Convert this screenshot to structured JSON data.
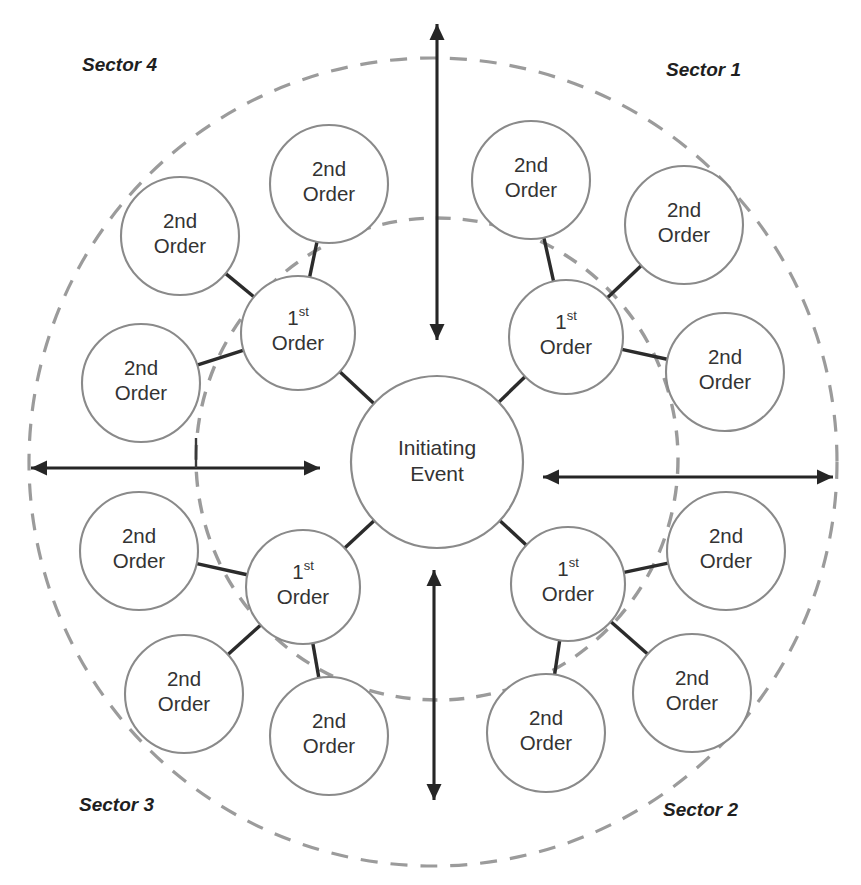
{
  "diagram": {
    "center_node": {
      "id": "initiating-event",
      "line1": "Initiating",
      "line2": "Event",
      "cx": 437,
      "cy": 462,
      "r": 86
    },
    "first_order_label": {
      "main": "1",
      "suffix": "st",
      "line2": "Order"
    },
    "second_order_label": {
      "line1": "2nd",
      "line2": "Order"
    },
    "rings": [
      {
        "id": "inner-dashed-ring",
        "cx": 437,
        "cy": 459,
        "r": 241,
        "style": "dashed"
      },
      {
        "id": "outer-dashed-ring",
        "cx": 433,
        "cy": 462,
        "r": 404,
        "style": "dashed"
      }
    ],
    "first_order_nodes": [
      {
        "id": "first-order-sector1",
        "sector": "Sector 1",
        "cx": 566,
        "cy": 337,
        "r": 57
      },
      {
        "id": "first-order-sector2",
        "sector": "Sector 2",
        "cx": 568,
        "cy": 584,
        "r": 57
      },
      {
        "id": "first-order-sector3",
        "sector": "Sector 3",
        "cx": 303,
        "cy": 587,
        "r": 57
      },
      {
        "id": "first-order-sector4",
        "sector": "Sector 4",
        "cx": 298,
        "cy": 333,
        "r": 57
      }
    ],
    "second_order_nodes": [
      {
        "id": "second-order-s1-a",
        "sector": "Sector 1",
        "cx": 531,
        "cy": 180,
        "r": 59
      },
      {
        "id": "second-order-s1-b",
        "sector": "Sector 1",
        "cx": 684,
        "cy": 225,
        "r": 59
      },
      {
        "id": "second-order-s1-c",
        "sector": "Sector 1",
        "cx": 725,
        "cy": 372,
        "r": 59
      },
      {
        "id": "second-order-s2-a",
        "sector": "Sector 2",
        "cx": 726,
        "cy": 551,
        "r": 59
      },
      {
        "id": "second-order-s2-b",
        "sector": "Sector 2",
        "cx": 692,
        "cy": 693,
        "r": 59
      },
      {
        "id": "second-order-s2-c",
        "sector": "Sector 2",
        "cx": 546,
        "cy": 733,
        "r": 59
      },
      {
        "id": "second-order-s3-a",
        "sector": "Sector 3",
        "cx": 329,
        "cy": 736,
        "r": 59
      },
      {
        "id": "second-order-s3-b",
        "sector": "Sector 3",
        "cx": 184,
        "cy": 694,
        "r": 59
      },
      {
        "id": "second-order-s3-c",
        "sector": "Sector 3",
        "cx": 139,
        "cy": 551,
        "r": 59
      },
      {
        "id": "second-order-s4-a",
        "sector": "Sector 4",
        "cx": 141,
        "cy": 383,
        "r": 59
      },
      {
        "id": "second-order-s4-b",
        "sector": "Sector 4",
        "cx": 180,
        "cy": 236,
        "r": 59
      },
      {
        "id": "second-order-s4-c",
        "sector": "Sector 4",
        "cx": 329,
        "cy": 184,
        "r": 59
      }
    ],
    "connectors": [
      {
        "from": "initiating-event",
        "to": "first-order-sector1"
      },
      {
        "from": "initiating-event",
        "to": "first-order-sector2"
      },
      {
        "from": "initiating-event",
        "to": "first-order-sector3"
      },
      {
        "from": "initiating-event",
        "to": "first-order-sector4"
      },
      {
        "from": "first-order-sector1",
        "to": "second-order-s1-a"
      },
      {
        "from": "first-order-sector1",
        "to": "second-order-s1-b"
      },
      {
        "from": "first-order-sector1",
        "to": "second-order-s1-c"
      },
      {
        "from": "first-order-sector2",
        "to": "second-order-s2-a"
      },
      {
        "from": "first-order-sector2",
        "to": "second-order-s2-b"
      },
      {
        "from": "first-order-sector2",
        "to": "second-order-s2-c"
      },
      {
        "from": "first-order-sector3",
        "to": "second-order-s3-a"
      },
      {
        "from": "first-order-sector3",
        "to": "second-order-s3-b"
      },
      {
        "from": "first-order-sector3",
        "to": "second-order-s3-c"
      },
      {
        "from": "first-order-sector4",
        "to": "second-order-s4-a"
      },
      {
        "from": "first-order-sector4",
        "to": "second-order-s4-b"
      },
      {
        "from": "first-order-sector4",
        "to": "second-order-s4-c"
      }
    ],
    "sector_labels": [
      {
        "id": "sector-label-4",
        "text": "Sector 4",
        "x": 82,
        "y": 66
      },
      {
        "id": "sector-label-1",
        "text": "Sector 1",
        "x": 666,
        "y": 71
      },
      {
        "id": "sector-label-3",
        "text": "Sector 3",
        "x": 79,
        "y": 806
      },
      {
        "id": "sector-label-2",
        "text": "Sector 2",
        "x": 663,
        "y": 811
      }
    ],
    "axis_arrows": [
      {
        "id": "axis-arrow-top",
        "orientation": "vertical",
        "x1": 437,
        "y1": 340,
        "x2": 437,
        "y2": 24
      },
      {
        "id": "axis-arrow-bottom",
        "orientation": "vertical",
        "x1": 434,
        "y1": 570,
        "x2": 434,
        "y2": 800
      },
      {
        "id": "axis-arrow-left",
        "orientation": "horizontal",
        "x1": 320,
        "y1": 468,
        "x2": 31,
        "y2": 468
      },
      {
        "id": "axis-arrow-right",
        "orientation": "horizontal",
        "x1": 543,
        "y1": 477,
        "x2": 833,
        "y2": 477
      }
    ],
    "colors": {
      "node_stroke": "#8a8a8a",
      "ring_stroke": "#9b9b9b",
      "connector_stroke": "#2b2b2b",
      "arrow_stroke": "#262626",
      "text": "#333333",
      "background": "#ffffff"
    }
  }
}
